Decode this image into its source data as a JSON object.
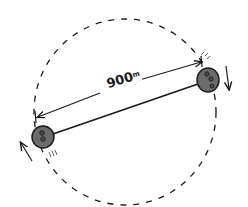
{
  "diagram": {
    "distance_label": "900",
    "distance_unit": "m",
    "colors": {
      "ink": "#1a1a1a",
      "body_fill": "#6b6b6b",
      "crater_fill": "#4a4a4a",
      "background": "#ffffff"
    },
    "orbit": {
      "cx": 125,
      "cy": 112,
      "rx": 91,
      "ry": 93,
      "style": "dashed"
    },
    "bodies": [
      {
        "name": "left-asteroid",
        "cx": 43,
        "cy": 137,
        "r": 11
      },
      {
        "name": "right-asteroid",
        "cx": 208,
        "cy": 79,
        "r": 11
      }
    ],
    "connector": {
      "x1": 53,
      "y1": 134,
      "x2": 198,
      "y2": 84
    },
    "dimension_arrow": {
      "x1": 37,
      "y1": 117,
      "x2": 202,
      "y2": 62
    },
    "rotation_arrows": [
      {
        "name": "left-rotation",
        "direction": "up"
      },
      {
        "name": "right-rotation",
        "direction": "down"
      }
    ]
  }
}
